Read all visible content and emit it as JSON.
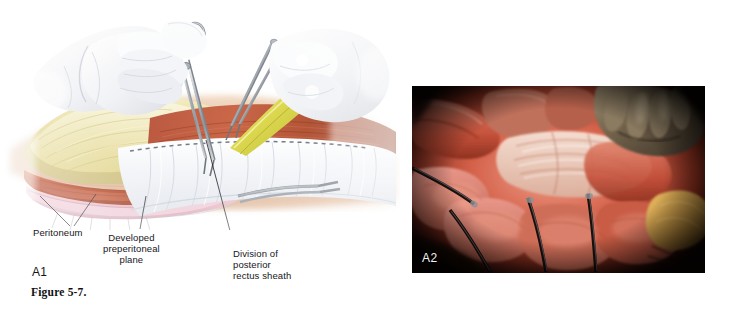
{
  "figure": {
    "caption": "Figure 5-7.",
    "background_color": "#ffffff"
  },
  "panel_a1": {
    "tag": "A1",
    "type": "medical-illustration",
    "description": "Surgical illustration of open abdominal wall dissection with two gloved hands, clamp, scissors and yellow retractor over a layered abdominal wall cross-section and white drape",
    "labels": [
      {
        "id": "peritoneum",
        "text": "Peritoneum",
        "align": "left"
      },
      {
        "id": "preperitoneal-plane",
        "text": "Developed\npreperitoneal\nplane",
        "align": "center"
      },
      {
        "id": "posterior-rectus-sheath",
        "text": "Division of\nposterior\nrectus sheath",
        "align": "left"
      }
    ],
    "anatomy_colors": {
      "skin": "#e9c7ab",
      "subcutaneous_fat": "#e6dda2",
      "muscle": "#c0542f",
      "peritoneum": "#edc6cf",
      "drape": "#f2f4f7",
      "glove": "#f6f7f9",
      "instrument_metal": "#9aa0a6",
      "retractor_yellow": "#ddd84e"
    }
  },
  "panel_a2": {
    "tag": "A2",
    "type": "intraoperative-photograph",
    "description": "Intraoperative photograph of open abdominal wall showing red muscle, white fascia, metal clamps and a gloved hand retracting tissue",
    "photo_colors": {
      "muscle_red": "#c8402f",
      "muscle_pink": "#d8705d",
      "fascia_white": "#efd9cd",
      "glove_tan": "#7c6a52",
      "fat_yellow": "#d6a64a",
      "shadow": "#1a0705",
      "border": "#140604"
    }
  }
}
